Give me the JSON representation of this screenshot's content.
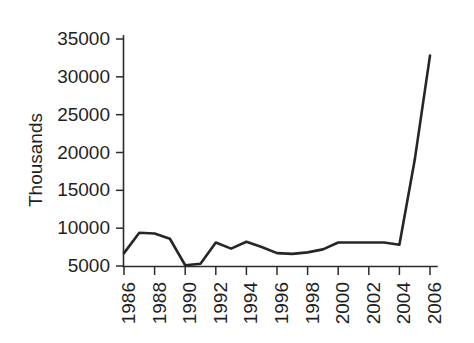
{
  "chart_data": {
    "type": "line",
    "title": "",
    "subtitle": "",
    "xlabel": "",
    "ylabel": "Thousands",
    "x": [
      1986,
      1987,
      1988,
      1989,
      1990,
      1991,
      1992,
      1993,
      1994,
      1995,
      1996,
      1997,
      1998,
      1999,
      2000,
      2001,
      2002,
      2003,
      2004,
      2005,
      2006
    ],
    "values": [
      6700,
      9400,
      9300,
      8600,
      5100,
      5300,
      8100,
      7300,
      8200,
      7500,
      6700,
      6600,
      6800,
      7200,
      8100,
      8100,
      8100,
      8100,
      7800,
      19000,
      32800
    ],
    "series": [
      {
        "name": "Thousands",
        "values": [
          6700,
          9400,
          9300,
          8600,
          5100,
          5300,
          8100,
          7300,
          8200,
          7500,
          6700,
          6600,
          6800,
          7200,
          8100,
          8100,
          8100,
          8100,
          7800,
          19000,
          32800
        ]
      }
    ],
    "xlim": [
      1986,
      2006
    ],
    "ylim": [
      5000,
      35000
    ],
    "xticks": [
      1986,
      1988,
      1990,
      1992,
      1994,
      1996,
      1998,
      2000,
      2002,
      2004,
      2006
    ],
    "xtick_labels": [
      "1986",
      "1988",
      "1990",
      "1992",
      "1994",
      "1996",
      "1998",
      "2000",
      "2002",
      "2004",
      "2006"
    ],
    "yticks": [
      5000,
      10000,
      15000,
      20000,
      25000,
      30000,
      35000
    ],
    "ytick_labels": [
      "5000",
      "10000",
      "15000",
      "20000",
      "25000",
      "30000",
      "35000"
    ],
    "xtick_label_rotation": -90,
    "grid": false,
    "legend": false,
    "legend_position": "none",
    "line_color": "#262626",
    "background_color": "#ffffff",
    "annotations": []
  }
}
